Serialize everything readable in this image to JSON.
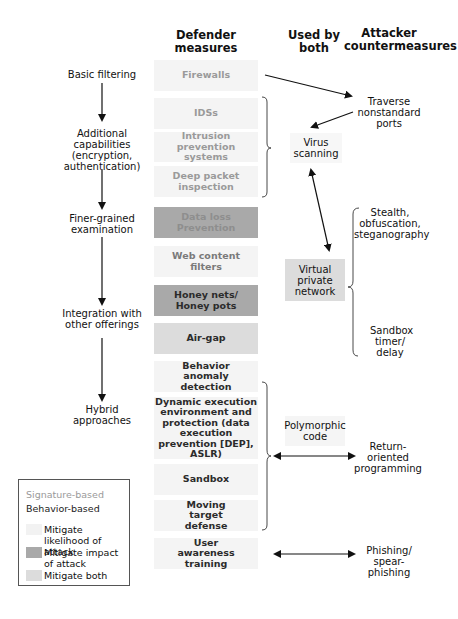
{
  "headers": {
    "defender": "Defender measures",
    "both": "Used by both",
    "attacker": "Attacker countermeasures"
  },
  "stages": [
    {
      "label": "Basic filtering"
    },
    {
      "label": "Additional capabilities (encryption, authentication)"
    },
    {
      "label": "Finer-grained examination"
    },
    {
      "label": "Integration with other offerings"
    },
    {
      "label": "Hybrid approaches"
    }
  ],
  "defender_measures": [
    {
      "label": "Firewalls",
      "approach": "signature-based",
      "mitigation": "likelihood"
    },
    {
      "label": "IDSs",
      "approach": "signature-based",
      "mitigation": "likelihood"
    },
    {
      "label": "Intrusion prevention systems",
      "approach": "signature-based",
      "mitigation": "likelihood"
    },
    {
      "label": "Deep packet inspection",
      "approach": "signature-based",
      "mitigation": "likelihood"
    },
    {
      "label": "Data loss Prevention",
      "approach": "signature-based",
      "mitigation": "impact"
    },
    {
      "label": "Web content filters",
      "approach": "behavior-based",
      "mitigation": "likelihood"
    },
    {
      "label": "Honey nets/ Honey pots",
      "approach": "behavior-based",
      "mitigation": "impact"
    },
    {
      "label": "Air-gap",
      "approach": "behavior-based",
      "mitigation": "both"
    },
    {
      "label": "Behavior anomaly detection",
      "approach": "behavior-based",
      "mitigation": "likelihood"
    },
    {
      "label": "Dynamic execution environment and protection (data execution prevention [DEP], ASLR)",
      "approach": "behavior-based",
      "mitigation": "likelihood"
    },
    {
      "label": "Sandbox",
      "approach": "behavior-based",
      "mitigation": "likelihood"
    },
    {
      "label": "Moving target defense",
      "approach": "behavior-based",
      "mitigation": "likelihood"
    },
    {
      "label": "User awareness training",
      "approach": "behavior-based",
      "mitigation": "likelihood"
    }
  ],
  "used_by_both": [
    {
      "label": "Virus scanning"
    },
    {
      "label": "Virtual private network"
    },
    {
      "label": "Polymorphic code"
    }
  ],
  "attacker_countermeasures": [
    {
      "label": "Traverse nonstandard ports"
    },
    {
      "label": "Stealth, obfuscation, steganography"
    },
    {
      "label": "Sandbox timer/ delay"
    },
    {
      "label": "Return-oriented programming"
    },
    {
      "label": "Phishing/ spear-phishing"
    }
  ],
  "legend": {
    "signature": "Signature-based",
    "behavior": "Behavior-based",
    "items": [
      {
        "label": "Mitigate likelihood of attack",
        "color": "#f4f4f4"
      },
      {
        "label": "Mitigate impact of attack",
        "color": "#a9a9a9"
      },
      {
        "label": "Mitigate both",
        "color": "#dcdcdc"
      }
    ]
  },
  "colors": {
    "likelihood": "#f4f4f4",
    "impact": "#a9a9a9",
    "both": "#dcdcdc",
    "signature_text": "#9a9a9a",
    "behavior_text": "#2b2b2b"
  }
}
